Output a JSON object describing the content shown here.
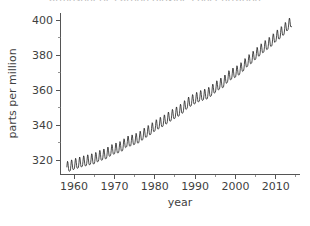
{
  "figure": {
    "background_color": "#ffffff",
    "line_color": "#111111",
    "axis_color": "#555555",
    "text_color": "#3f3f3f",
    "cropped_title": "atmospheric carbon dioxide concentration"
  },
  "chart_data": {
    "type": "line",
    "title": "",
    "xlabel": "year",
    "ylabel": "parts per million",
    "xlim": [
      1956.5,
      2016.0
    ],
    "ylim": [
      312.0,
      404.0
    ],
    "grid": false,
    "legend": null,
    "x_ticks": [
      1960,
      1970,
      1980,
      1990,
      2000,
      2010
    ],
    "x_tick_labels": [
      "1960",
      "1970",
      "1980",
      "1990",
      "2000",
      "2010"
    ],
    "x_minor_ticks": [
      1965,
      1975,
      1985,
      1995,
      2005,
      2015
    ],
    "y_ticks": [
      320,
      340,
      360,
      380,
      400
    ],
    "y_tick_labels": [
      "320",
      "340",
      "360",
      "380",
      "400"
    ],
    "y_minor_ticks": [
      330,
      350,
      370,
      390
    ],
    "series": [
      {
        "name": "CO2 concentration (monthly mean)",
        "description": "Monthly mean atmospheric CO2 with seasonal sawtooth oscillation superimposed on a rising trend",
        "seasonal_amplitude_ppm": 3.0,
        "x": [
          1958.2,
          1959.0,
          1960.0,
          1961.0,
          1962.0,
          1963.0,
          1964.0,
          1965.0,
          1966.0,
          1967.0,
          1968.0,
          1969.0,
          1970.0,
          1971.0,
          1972.0,
          1973.0,
          1974.0,
          1975.0,
          1976.0,
          1977.0,
          1978.0,
          1979.0,
          1980.0,
          1981.0,
          1982.0,
          1983.0,
          1984.0,
          1985.0,
          1986.0,
          1987.0,
          1988.0,
          1989.0,
          1990.0,
          1991.0,
          1992.0,
          1993.0,
          1994.0,
          1995.0,
          1996.0,
          1997.0,
          1998.0,
          1999.0,
          2000.0,
          2001.0,
          2002.0,
          2003.0,
          2004.0,
          2005.0,
          2006.0,
          2007.0,
          2008.0,
          2009.0,
          2010.0,
          2011.0,
          2012.0,
          2013.0,
          2014.0
        ],
        "y": [
          315.3,
          315.9,
          316.9,
          317.6,
          318.4,
          318.9,
          319.6,
          320.0,
          321.4,
          322.2,
          323.0,
          324.6,
          325.7,
          326.3,
          327.5,
          329.7,
          330.2,
          331.1,
          332.0,
          333.8,
          335.4,
          336.8,
          338.7,
          340.1,
          341.4,
          343.0,
          344.6,
          346.0,
          347.4,
          349.2,
          351.6,
          353.1,
          354.4,
          355.6,
          356.4,
          357.1,
          358.8,
          360.8,
          362.6,
          363.7,
          366.6,
          368.3,
          369.5,
          371.0,
          373.2,
          375.8,
          377.5,
          379.8,
          381.9,
          383.8,
          385.6,
          387.4,
          389.9,
          391.6,
          393.8,
          396.5,
          398.6
        ]
      }
    ]
  }
}
